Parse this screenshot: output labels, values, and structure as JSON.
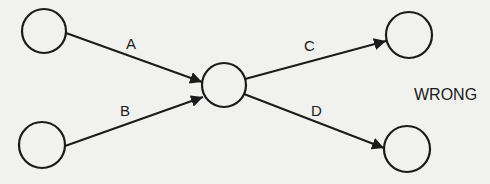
{
  "diagram": {
    "caption": "WRONG",
    "nodes": [
      {
        "id": "n1",
        "cx": 44,
        "cy": 31,
        "r": 22
      },
      {
        "id": "n2",
        "cx": 42,
        "cy": 145,
        "r": 23
      },
      {
        "id": "n3",
        "cx": 224,
        "cy": 85,
        "r": 22
      },
      {
        "id": "n4",
        "cx": 409,
        "cy": 35,
        "r": 23
      },
      {
        "id": "n5",
        "cx": 407,
        "cy": 149,
        "r": 23
      }
    ],
    "edges": [
      {
        "label": "A",
        "from": "n1",
        "to": "n3"
      },
      {
        "label": "B",
        "from": "n2",
        "to": "n3"
      },
      {
        "label": "C",
        "from": "n3",
        "to": "n4"
      },
      {
        "label": "D",
        "from": "n3",
        "to": "n5"
      }
    ],
    "colors": {
      "stroke": "#1b1b1b",
      "background": "#f1f1ef"
    }
  }
}
